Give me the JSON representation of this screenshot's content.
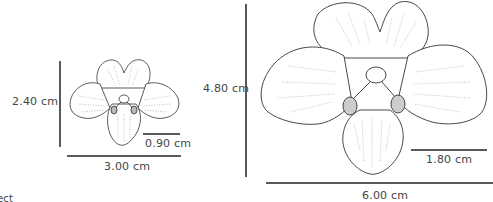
{
  "diagram": {
    "small_orchid": {
      "height_label": "2.40 cm",
      "width_label": "3.00 cm",
      "scale_bar_label": "0.90 cm"
    },
    "large_orchid": {
      "height_label": "4.80 cm",
      "width_label": "6.00 cm",
      "scale_bar_label": "1.80 cm"
    },
    "cropped_caption": "ect"
  },
  "colors": {
    "line": "#222222",
    "text": "#444444"
  }
}
